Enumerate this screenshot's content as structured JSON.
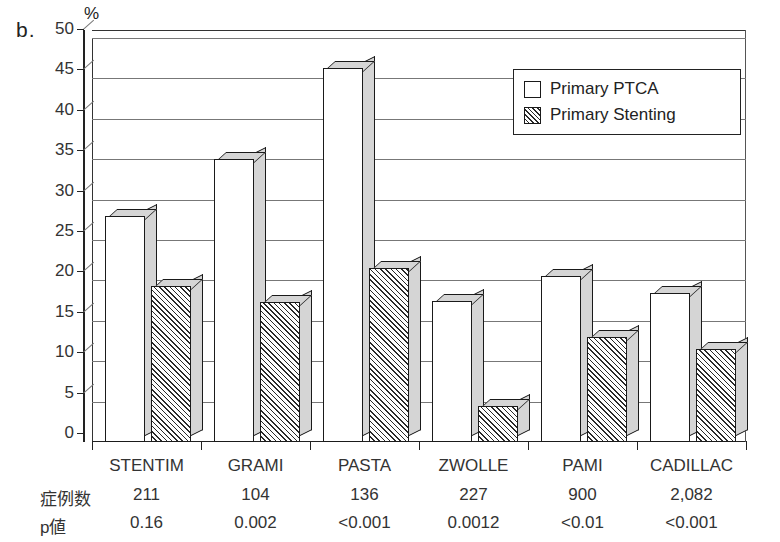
{
  "panel": {
    "letter": "b."
  },
  "chart_data": {
    "type": "bar",
    "title": "",
    "subtitle": "",
    "xlabel": "",
    "ylabel": "%",
    "ylim": [
      0,
      50
    ],
    "ytick_step": 5,
    "yticks": [
      "50",
      "45",
      "40",
      "35",
      "30",
      "25",
      "20",
      "15",
      "10",
      "5",
      "0"
    ],
    "grid": true,
    "legend_position": "top-right",
    "categories": [
      "STENTIM",
      "GRAMI",
      "PASTA",
      "ZWOLLE",
      "PAMI",
      "CADILLAC"
    ],
    "series": [
      {
        "name": "Primary PTCA",
        "fill": "white",
        "values": [
          28,
          35,
          46.3,
          17.5,
          20.5,
          18.5
        ]
      },
      {
        "name": "Primary Stenting",
        "fill": "hatched",
        "values": [
          19.3,
          17.3,
          21.5,
          4.5,
          13,
          11.5
        ]
      }
    ],
    "annotations": {
      "row_labels": [
        "症例数",
        "p値"
      ],
      "rows": [
        {
          "label": "症例数",
          "values": [
            "211",
            "104",
            "136",
            "227",
            "900",
            "2,082"
          ]
        },
        {
          "label": "p値",
          "values": [
            "0.16",
            "0.002",
            "<0.001",
            "0.0012",
            "<0.01",
            "<0.001"
          ]
        }
      ]
    }
  },
  "legend": {
    "items": [
      {
        "label": "Primary PTCA",
        "style": "open"
      },
      {
        "label": "Primary Stenting",
        "style": "hatched"
      }
    ]
  },
  "colors": {
    "axis": "#222222",
    "gridline": "#777777",
    "bar_front": "#ffffff",
    "bar_shade": "#d5d5d5",
    "hatch": "#2a2a2a",
    "text": "#333333",
    "background": "#ffffff"
  }
}
